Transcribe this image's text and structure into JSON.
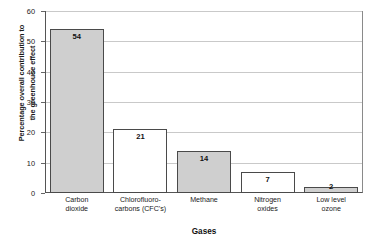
{
  "chart_data": {
    "type": "bar",
    "title": "",
    "xlabel": "Gases",
    "ylabel": "Percentage overall contribution to the greenhouse effect",
    "ylabel_line1": "Percentage overall contribution to",
    "ylabel_line2": "the greenhouse effect",
    "categories": [
      "Carbon dioxide",
      "Chlorofluoro-carbons (CFC's)",
      "Methane",
      "Nitrogen oxides",
      "Low level ozone"
    ],
    "category_lines": [
      [
        "Carbon",
        "dioxide"
      ],
      [
        "Chlorofluoro-",
        "carbons (CFC's)"
      ],
      [
        "Methane",
        ""
      ],
      [
        "Nitrogen",
        "oxides"
      ],
      [
        "Low level",
        "ozone"
      ]
    ],
    "values": [
      54,
      21,
      14,
      7,
      2
    ],
    "value_labels": [
      "54",
      "21",
      "14",
      "7",
      "2"
    ],
    "bar_fills": [
      "filled",
      "open",
      "filled",
      "open",
      "filled"
    ],
    "ylim": [
      0,
      60
    ],
    "yticks": [
      0,
      10,
      20,
      30,
      40,
      50,
      60
    ],
    "ytick_labels": [
      "0",
      "10",
      "20",
      "30",
      "40",
      "50",
      "60"
    ],
    "grid": true,
    "legend": "none",
    "colors": {
      "bar_fill": "#cfcfcf",
      "bar_open": "#ffffff",
      "bar_edge": "#4a4a4a",
      "gridline": "#c9c9c9",
      "axis": "#555555",
      "text": "#1a1a1a",
      "background": "#ffffff"
    }
  }
}
